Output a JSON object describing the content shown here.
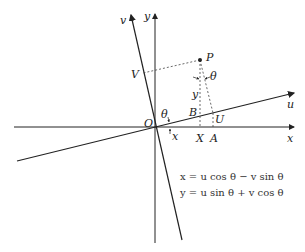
{
  "diagram": {
    "labels": {
      "x_axis": "x",
      "y_axis": "y",
      "u_axis": "u",
      "v_axis": "v",
      "origin": "O",
      "point_p": "P",
      "point_v": "V",
      "point_b": "B",
      "point_u": "U",
      "point_x": "X",
      "point_a": "A",
      "angle_theta_origin": "θ",
      "angle_theta_p": "θ",
      "seg_y": "y",
      "seg_x": "x"
    },
    "equations": [
      "x = u cos θ − v sin θ",
      "y = u sin θ + v cos θ"
    ],
    "colors": {
      "line": "#222222",
      "dashed": "#444444",
      "text": "#222222"
    }
  }
}
